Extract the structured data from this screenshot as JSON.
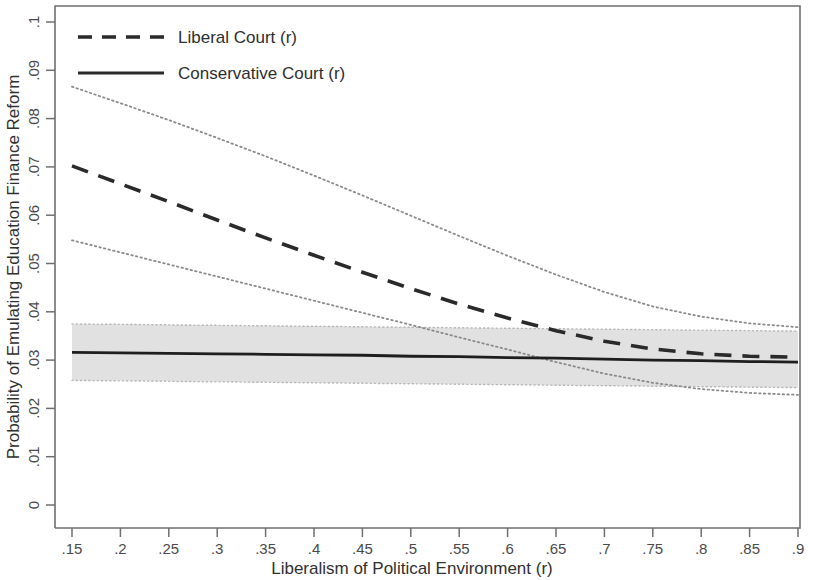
{
  "chart_data": {
    "type": "line",
    "title": "",
    "xlabel": "Liberalism of Political Environment (r)",
    "ylabel": "Probability of Emulating Education Finance Reform",
    "xlim": [
      0.15,
      0.9
    ],
    "ylim": [
      0,
      0.1
    ],
    "grid": false,
    "legend_position": "top-left",
    "xticks": [
      0.15,
      0.2,
      0.25,
      0.3,
      0.35,
      0.4,
      0.45,
      0.5,
      0.55,
      0.6,
      0.65,
      0.7,
      0.75,
      0.8,
      0.85,
      0.9
    ],
    "xticklabels": [
      ".15",
      ".2",
      ".25",
      ".3",
      ".35",
      ".4",
      ".45",
      ".5",
      ".55",
      ".6",
      ".65",
      ".7",
      ".75",
      ".8",
      ".85",
      ".9"
    ],
    "yticks": [
      0,
      0.01,
      0.02,
      0.03,
      0.04,
      0.05,
      0.06,
      0.07,
      0.08,
      0.09,
      0.1
    ],
    "yticklabels": [
      "0",
      ".01",
      ".02",
      ".03",
      ".04",
      ".05",
      ".06",
      ".07",
      ".08",
      ".09",
      ".1"
    ],
    "x": [
      0.15,
      0.2,
      0.25,
      0.3,
      0.35,
      0.4,
      0.45,
      0.5,
      0.55,
      0.6,
      0.65,
      0.7,
      0.75,
      0.8,
      0.85,
      0.9
    ],
    "series": [
      {
        "name": "Liberal Court (r)",
        "style": "dashed",
        "color": "#2a2a2a",
        "values": [
          0.0702,
          0.0665,
          0.0628,
          0.059,
          0.0553,
          0.0517,
          0.0482,
          0.0448,
          0.0416,
          0.0387,
          0.0361,
          0.0339,
          0.0323,
          0.0313,
          0.0308,
          0.0306
        ],
        "ci_upper": [
          0.0866,
          0.0832,
          0.0797,
          0.076,
          0.0722,
          0.0682,
          0.0641,
          0.0599,
          0.0557,
          0.0516,
          0.0477,
          0.0441,
          0.0411,
          0.039,
          0.0376,
          0.0368
        ],
        "ci_lower": [
          0.0548,
          0.0523,
          0.0498,
          0.0473,
          0.0448,
          0.0423,
          0.0398,
          0.0373,
          0.0347,
          0.0322,
          0.0296,
          0.0272,
          0.0253,
          0.024,
          0.0232,
          0.0228
        ],
        "ci_style": "dotted"
      },
      {
        "name": "Conservative Court (r)",
        "style": "solid",
        "color": "#1e1e1e",
        "values": [
          0.0316,
          0.0315,
          0.0314,
          0.0313,
          0.0312,
          0.0311,
          0.031,
          0.0308,
          0.0307,
          0.0305,
          0.0304,
          0.0302,
          0.03,
          0.0299,
          0.0297,
          0.0296
        ],
        "ci_upper": [
          0.0375,
          0.0374,
          0.0373,
          0.0372,
          0.0371,
          0.037,
          0.0369,
          0.0368,
          0.0367,
          0.0366,
          0.0365,
          0.0364,
          0.0363,
          0.0362,
          0.0361,
          0.036
        ],
        "ci_lower": [
          0.0258,
          0.0257,
          0.0256,
          0.0255,
          0.0254,
          0.0253,
          0.0252,
          0.0251,
          0.025,
          0.0249,
          0.0248,
          0.0247,
          0.0246,
          0.0245,
          0.0244,
          0.0243
        ],
        "ci_style": "shaded",
        "ci_color": "#dcdcdc"
      }
    ],
    "legend": [
      {
        "label": "Liberal Court (r)",
        "style": "dashed"
      },
      {
        "label": "Conservative Court (r)",
        "style": "solid"
      }
    ]
  }
}
